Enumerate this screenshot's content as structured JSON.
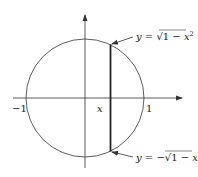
{
  "diagram": {
    "colors": {
      "stroke": "#333333",
      "text": "#222222",
      "background": "#ffffff"
    },
    "axes": {
      "x_left_label": "−1",
      "x_right_label": "1",
      "x_point_label": "x"
    },
    "curves": {
      "upper": {
        "lhs": "y",
        "eq": " = ",
        "sqrt": "√",
        "rad": "1 − ",
        "var": "x",
        "exp": "2"
      },
      "lower": {
        "lhs": "y",
        "eq": " = −",
        "sqrt": "√",
        "rad": "1 − ",
        "var": "x",
        "exp": "2"
      }
    }
  }
}
